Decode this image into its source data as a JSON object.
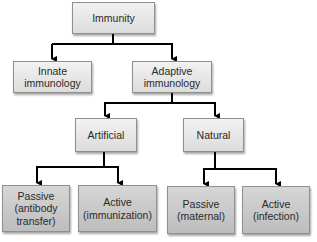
{
  "diagram": {
    "title": "Immunity",
    "nodes": {
      "root": {
        "label": "Immunity"
      },
      "innate": {
        "label": "Innate\nimmunology"
      },
      "adaptive": {
        "label": "Adaptive\nimmunology"
      },
      "artificial": {
        "label": "Artificial"
      },
      "natural": {
        "label": "Natural"
      },
      "passive_artificial": {
        "label": "Passive\n(antibody\ntransfer)"
      },
      "active_artificial": {
        "label": "Active\n(immunization)"
      },
      "passive_natural": {
        "label": "Passive\n(maternal)"
      },
      "active_natural": {
        "label": "Active\n(infection)"
      }
    },
    "edges": [
      [
        "Immunity",
        "Innate immunology"
      ],
      [
        "Immunity",
        "Adaptive immunology"
      ],
      [
        "Adaptive immunology",
        "Artificial"
      ],
      [
        "Adaptive immunology",
        "Natural"
      ],
      [
        "Artificial",
        "Passive (antibody transfer)"
      ],
      [
        "Artificial",
        "Active (immunization)"
      ],
      [
        "Natural",
        "Passive (maternal)"
      ],
      [
        "Natural",
        "Active (infection)"
      ]
    ],
    "colors": {
      "box_light": "#e6e6e6",
      "box_dark": "#c8c8c8",
      "border": "#8f8f8f",
      "connector": "#000000"
    }
  }
}
